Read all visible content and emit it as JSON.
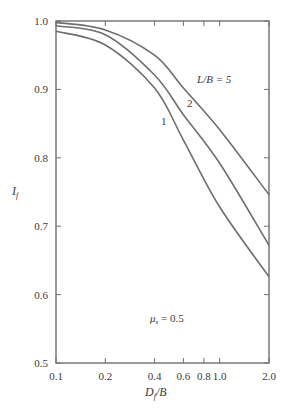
{
  "chart_data": {
    "type": "line",
    "title": "",
    "xlabel": "D_f/B",
    "ylabel": "I_f",
    "xscale": "log",
    "xlim": [
      0.1,
      2.0
    ],
    "ylim": [
      0.5,
      1.0
    ],
    "grid": false,
    "x_ticks": [
      0.1,
      0.2,
      0.4,
      0.6,
      0.8,
      1.0,
      2.0
    ],
    "x_tick_labels": [
      "0.1",
      "0.2",
      "0.4",
      "0.6",
      "0.8",
      "1.0",
      "2.0"
    ],
    "y_ticks": [
      0.5,
      0.6,
      0.7,
      0.8,
      0.9,
      1.0
    ],
    "y_tick_labels": [
      "0.5",
      "0.6",
      "0.7",
      "0.8",
      "0.9",
      "1.0"
    ],
    "x": [
      0.1,
      0.2,
      0.4,
      0.6,
      1.0,
      2.0
    ],
    "series": [
      {
        "name": "L/B = 5",
        "label": "L/B = 5",
        "values": [
          0.998,
          0.987,
          0.95,
          0.902,
          0.841,
          0.746
        ]
      },
      {
        "name": "L/B = 2",
        "label": "2",
        "values": [
          0.993,
          0.98,
          0.921,
          0.863,
          0.792,
          0.672
        ]
      },
      {
        "name": "L/B = 1",
        "label": "1",
        "values": [
          0.985,
          0.965,
          0.902,
          0.826,
          0.728,
          0.626
        ]
      }
    ],
    "annotations": [
      "μs = 0.5"
    ]
  },
  "labels": {
    "ylabel_main": "I",
    "ylabel_sub": "f",
    "xlabel_main": "D",
    "xlabel_sub": "f",
    "xlabel_tail": "/B",
    "curve5": "L/B = 5",
    "curve2": "2",
    "curve1": "1",
    "mu_main": "μ",
    "mu_sub": "s",
    "mu_tail": " = 0.5"
  }
}
